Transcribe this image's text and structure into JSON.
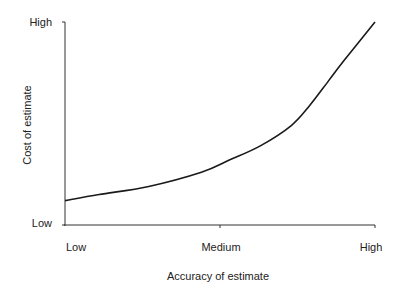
{
  "chart_data": {
    "type": "line",
    "title": "",
    "xlabel": "Accuracy of estimate",
    "ylabel": "Cost of estimate",
    "x_tick_labels": [
      "Low",
      "Medium",
      "High"
    ],
    "y_tick_labels": [
      "Low",
      "High"
    ],
    "xlim": [
      0,
      1
    ],
    "ylim": [
      0,
      1
    ],
    "grid": false,
    "legend": null,
    "series": [
      {
        "name": "Cost vs accuracy",
        "color": "#1a1a1a",
        "x": [
          0.0,
          0.11,
          0.27,
          0.44,
          0.53,
          0.63,
          0.73,
          0.79,
          0.85,
          0.9,
          1.0
        ],
        "y": [
          0.12,
          0.15,
          0.19,
          0.26,
          0.32,
          0.39,
          0.49,
          0.59,
          0.71,
          0.81,
          1.0
        ]
      }
    ]
  },
  "axes": {
    "x": {
      "title": "Accuracy of estimate",
      "ticks": [
        "Low",
        "Medium",
        "High"
      ]
    },
    "y": {
      "title": "Cost of estimate",
      "ticks": [
        "Low",
        "High"
      ]
    }
  }
}
